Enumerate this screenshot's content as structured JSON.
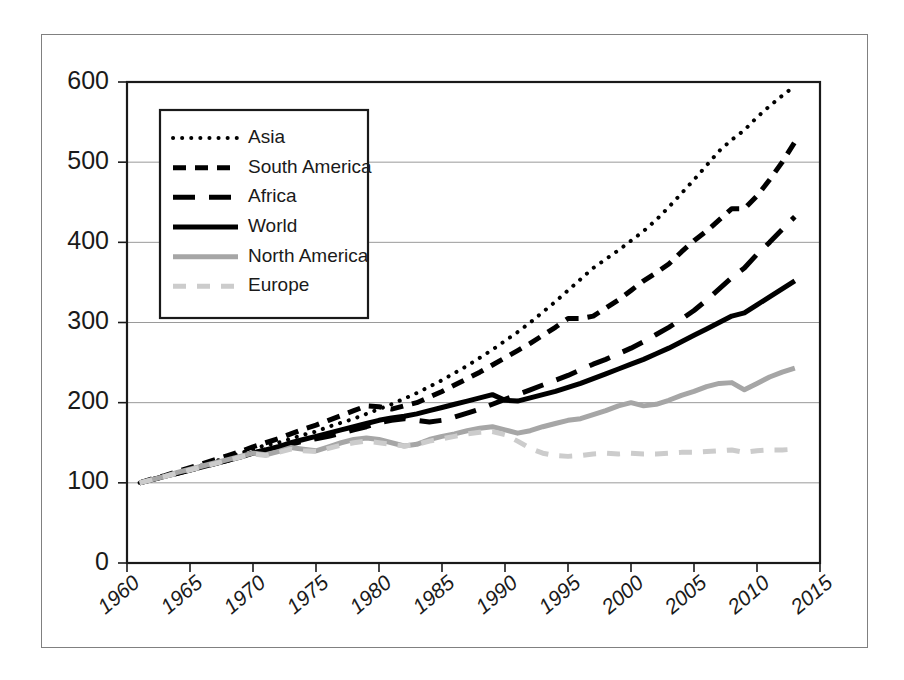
{
  "chart_data": {
    "type": "line",
    "title": "",
    "xlabel": "",
    "ylabel": "",
    "xlim": [
      1960,
      2015
    ],
    "ylim": [
      0,
      600
    ],
    "ytick_values": [
      0,
      100,
      200,
      300,
      400,
      500,
      600
    ],
    "ytick_labels": [
      "0",
      "100",
      "200",
      "300",
      "400",
      "500",
      "600"
    ],
    "xtick_values": [
      1960,
      1965,
      1970,
      1975,
      1980,
      1985,
      1990,
      1995,
      2000,
      2005,
      2010,
      2015
    ],
    "xtick_labels": [
      "1960",
      "1965",
      "1970",
      "1975",
      "1980",
      "1985",
      "1990",
      "1995",
      "2000",
      "2005",
      "2010",
      "2015"
    ],
    "grid": "horizontal",
    "legend_position": "upper-left-inside",
    "x": [
      1961,
      1962,
      1963,
      1964,
      1965,
      1966,
      1967,
      1968,
      1969,
      1970,
      1971,
      1972,
      1973,
      1974,
      1975,
      1976,
      1977,
      1978,
      1979,
      1980,
      1981,
      1982,
      1983,
      1984,
      1985,
      1986,
      1987,
      1988,
      1989,
      1990,
      1991,
      1992,
      1993,
      1994,
      1995,
      1996,
      1997,
      1998,
      1999,
      2000,
      2001,
      2002,
      2003,
      2004,
      2005,
      2006,
      2007,
      2008,
      2009,
      2010,
      2011,
      2012,
      2013
    ],
    "series": [
      {
        "name": "Asia",
        "color": "#000000",
        "style": "dotted",
        "width": 4,
        "values": [
          100,
          104,
          109,
          113,
          118,
          122,
          127,
          132,
          137,
          142,
          147,
          150,
          155,
          160,
          164,
          170,
          175,
          180,
          186,
          192,
          198,
          205,
          212,
          220,
          228,
          237,
          246,
          256,
          266,
          277,
          288,
          300,
          313,
          326,
          340,
          354,
          368,
          379,
          390,
          402,
          414,
          428,
          444,
          461,
          478,
          496,
          514,
          528,
          540,
          556,
          570,
          583,
          595
        ]
      },
      {
        "name": "South America",
        "color": "#000000",
        "style": "dashed-short",
        "width": 5,
        "values": [
          100,
          105,
          109,
          114,
          119,
          124,
          129,
          134,
          139,
          145,
          150,
          155,
          161,
          167,
          172,
          178,
          184,
          190,
          196,
          195,
          192,
          196,
          200,
          207,
          214,
          222,
          230,
          238,
          247,
          256,
          265,
          274,
          284,
          294,
          305,
          305,
          308,
          318,
          328,
          340,
          352,
          362,
          373,
          388,
          402,
          414,
          428,
          442,
          442,
          458,
          478,
          500,
          525
        ]
      },
      {
        "name": "Africa",
        "color": "#000000",
        "style": "dashed-long",
        "width": 5,
        "values": [
          100,
          104,
          108,
          112,
          116,
          120,
          124,
          128,
          133,
          137,
          141,
          145,
          148,
          152,
          155,
          158,
          162,
          166,
          170,
          175,
          178,
          180,
          178,
          176,
          178,
          182,
          187,
          192,
          198,
          204,
          210,
          216,
          222,
          228,
          234,
          241,
          248,
          254,
          261,
          268,
          276,
          285,
          294,
          304,
          315,
          328,
          342,
          356,
          368,
          385,
          400,
          416,
          432
        ]
      },
      {
        "name": "World",
        "color": "#000000",
        "style": "solid",
        "width": 5,
        "values": [
          100,
          104,
          108,
          112,
          116,
          120,
          124,
          128,
          132,
          137,
          141,
          145,
          150,
          154,
          158,
          162,
          166,
          170,
          174,
          178,
          181,
          183,
          186,
          190,
          194,
          198,
          202,
          206,
          210,
          203,
          202,
          206,
          210,
          214,
          219,
          224,
          230,
          236,
          242,
          248,
          254,
          261,
          268,
          276,
          284,
          292,
          300,
          308,
          312,
          322,
          332,
          342,
          352
        ]
      },
      {
        "name": "North America",
        "color": "#a6a6a6",
        "style": "solid",
        "width": 5,
        "values": [
          100,
          104,
          108,
          113,
          117,
          121,
          125,
          129,
          133,
          137,
          135,
          139,
          144,
          142,
          140,
          145,
          150,
          154,
          156,
          154,
          150,
          146,
          148,
          154,
          158,
          161,
          165,
          168,
          170,
          166,
          162,
          165,
          170,
          174,
          178,
          180,
          185,
          190,
          196,
          200,
          196,
          198,
          203,
          209,
          214,
          220,
          224,
          225,
          216,
          224,
          232,
          238,
          243
        ]
      },
      {
        "name": "Europe",
        "color": "#cccccc",
        "style": "dashed-gray",
        "width": 5,
        "values": [
          100,
          104,
          108,
          112,
          116,
          120,
          124,
          128,
          132,
          136,
          134,
          138,
          142,
          140,
          139,
          143,
          147,
          150,
          152,
          150,
          148,
          146,
          148,
          152,
          155,
          158,
          161,
          163,
          164,
          160,
          152,
          143,
          137,
          134,
          133,
          134,
          136,
          137,
          136,
          137,
          136,
          136,
          137,
          138,
          138,
          139,
          140,
          141,
          138,
          140,
          141,
          141,
          142
        ]
      }
    ]
  },
  "legend": {
    "entries": [
      {
        "label": "Asia"
      },
      {
        "label": "South America"
      },
      {
        "label": "Africa"
      },
      {
        "label": "World"
      },
      {
        "label": "North America"
      },
      {
        "label": "Europe"
      }
    ]
  }
}
